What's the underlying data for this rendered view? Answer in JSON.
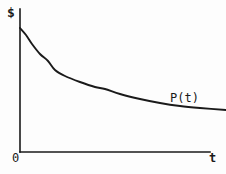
{
  "figure": {
    "kind": "line-plot",
    "background_color": "#fdfdfd",
    "ink_color": "#1a1a1a",
    "width": 226,
    "height": 174
  },
  "axes": {
    "y_axis_label": "$",
    "x_axis_label": "t",
    "origin_label": "0",
    "y_axis": {
      "x": 20,
      "y_top": 9,
      "y_bottom": 152
    },
    "x_axis": {
      "y": 152,
      "x_left": 20,
      "x_right": 210
    }
  },
  "annotations": {
    "curve_label": "P(t)"
  },
  "chart_data": {
    "type": "line",
    "title": "",
    "xlabel": "t",
    "ylabel": "$",
    "grid": false,
    "legend": "none",
    "xlim": [
      0,
      1
    ],
    "ylim": [
      0,
      1
    ],
    "series": [
      {
        "name": "P(t)",
        "description": "exponential decay curve",
        "points_px": [
          [
            20,
            28
          ],
          [
            26,
            35
          ],
          [
            32,
            44
          ],
          [
            40,
            54
          ],
          [
            48,
            61
          ],
          [
            55,
            70
          ],
          [
            65,
            76
          ],
          [
            80,
            82
          ],
          [
            95,
            87
          ],
          [
            105,
            89
          ],
          [
            120,
            94
          ],
          [
            140,
            99
          ],
          [
            160,
            103
          ],
          [
            180,
            106
          ],
          [
            200,
            108
          ],
          [
            226,
            110
          ]
        ],
        "points_data": [
          [
            0.0,
            1.0
          ],
          [
            0.03,
            0.94
          ],
          [
            0.06,
            0.87
          ],
          [
            0.1,
            0.79
          ],
          [
            0.14,
            0.74
          ],
          [
            0.17,
            0.67
          ],
          [
            0.22,
            0.63
          ],
          [
            0.29,
            0.58
          ],
          [
            0.36,
            0.55
          ],
          [
            0.41,
            0.53
          ],
          [
            0.49,
            0.5
          ],
          [
            0.58,
            0.46
          ],
          [
            0.68,
            0.44
          ],
          [
            0.78,
            0.42
          ],
          [
            0.87,
            0.41
          ],
          [
            1.0,
            0.39
          ]
        ]
      }
    ]
  }
}
